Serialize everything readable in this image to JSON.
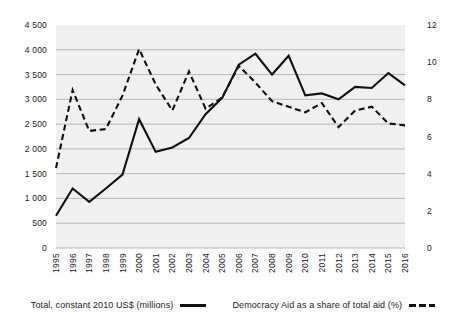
{
  "chart_data": {
    "type": "line",
    "title": "",
    "subtitle": "",
    "xlabel": "",
    "ylabel": "",
    "grid": true,
    "legend_position": "bottom",
    "x": [
      1995,
      1996,
      1997,
      1998,
      1999,
      2000,
      2001,
      2002,
      2003,
      2004,
      2005,
      2006,
      2007,
      2008,
      2009,
      2010,
      2011,
      2012,
      2013,
      2014,
      2015,
      2016
    ],
    "categories": [
      "1995",
      "1996",
      "1997",
      "1998",
      "1999",
      "2000",
      "2001",
      "2002",
      "2003",
      "2004",
      "2005",
      "2006",
      "2007",
      "2008",
      "2009",
      "2010",
      "2011",
      "2012",
      "2013",
      "2014",
      "2015",
      "2016"
    ],
    "axes": {
      "left": {
        "label": "Total, constant 2010 US$ (millions)",
        "ticks": [
          "0",
          "500",
          "1 000",
          "1 500",
          "2 000",
          "2 500",
          "3 000",
          "3 500",
          "4 000",
          "4 500"
        ],
        "tick_values": [
          0,
          500,
          1000,
          1500,
          2000,
          2500,
          3000,
          3500,
          4000,
          4500
        ],
        "ylim": [
          0,
          4500
        ]
      },
      "right": {
        "label": "Democracy Aid as a share of total aid (%)",
        "ticks": [
          "0",
          "2",
          "4",
          "6",
          "8",
          "10",
          "12"
        ],
        "tick_values": [
          0,
          2,
          4,
          6,
          8,
          10,
          12
        ],
        "ylim": [
          0,
          12
        ]
      }
    },
    "series": [
      {
        "name": "Total, constant 2010 US$ (millions)",
        "axis": "left",
        "style": "solid",
        "color": "#111111",
        "values": [
          650,
          1200,
          930,
          1200,
          1480,
          2600,
          1940,
          2030,
          2220,
          2700,
          3030,
          3700,
          3920,
          3500,
          3880,
          3080,
          3120,
          3000,
          3250,
          3230,
          3530,
          3280
        ]
      },
      {
        "name": "Democracy Aid as a share of total aid (%)",
        "axis": "right",
        "style": "dashed",
        "color": "#111111",
        "values": [
          4.3,
          8.5,
          6.3,
          6.4,
          8.2,
          10.7,
          8.8,
          7.4,
          9.5,
          7.5,
          8.1,
          9.8,
          8.9,
          7.9,
          7.6,
          7.3,
          7.8,
          6.5,
          7.4,
          7.6,
          6.7,
          6.6
        ]
      }
    ]
  },
  "legend": {
    "items": [
      {
        "label": "Total, constant 2010 US$ (millions)",
        "style": "solid"
      },
      {
        "label": "Democracy Aid as a share of total aid (%)",
        "style": "dashed"
      }
    ]
  }
}
